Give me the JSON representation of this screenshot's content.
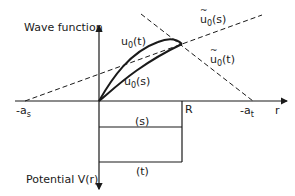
{
  "diagram": {
    "y_axis_label_top": "Wave function",
    "y_axis_label_bottom": "Potential V(r)",
    "x_axis_label": "r",
    "x_markers": {
      "neg_as": {
        "main": "-a",
        "sub": "s"
      },
      "R": "R",
      "neg_at": {
        "main": "-a",
        "sub": "t"
      }
    },
    "curves": {
      "u0_t": {
        "main": "u",
        "sub": "0",
        "arg": "(t)"
      },
      "u0_s": {
        "main": "u",
        "sub": "0",
        "arg": "(s)"
      },
      "u0tilde_s": {
        "main": "u",
        "sub": "0",
        "arg": "(s)"
      },
      "u0tilde_t": {
        "main": "u",
        "sub": "0",
        "arg": "(t)"
      }
    },
    "wells": {
      "singlet_label": "(s)",
      "triplet_label": "(t)"
    },
    "colors": {
      "ink": "#1a1a1a",
      "background": "#ffffff"
    }
  }
}
